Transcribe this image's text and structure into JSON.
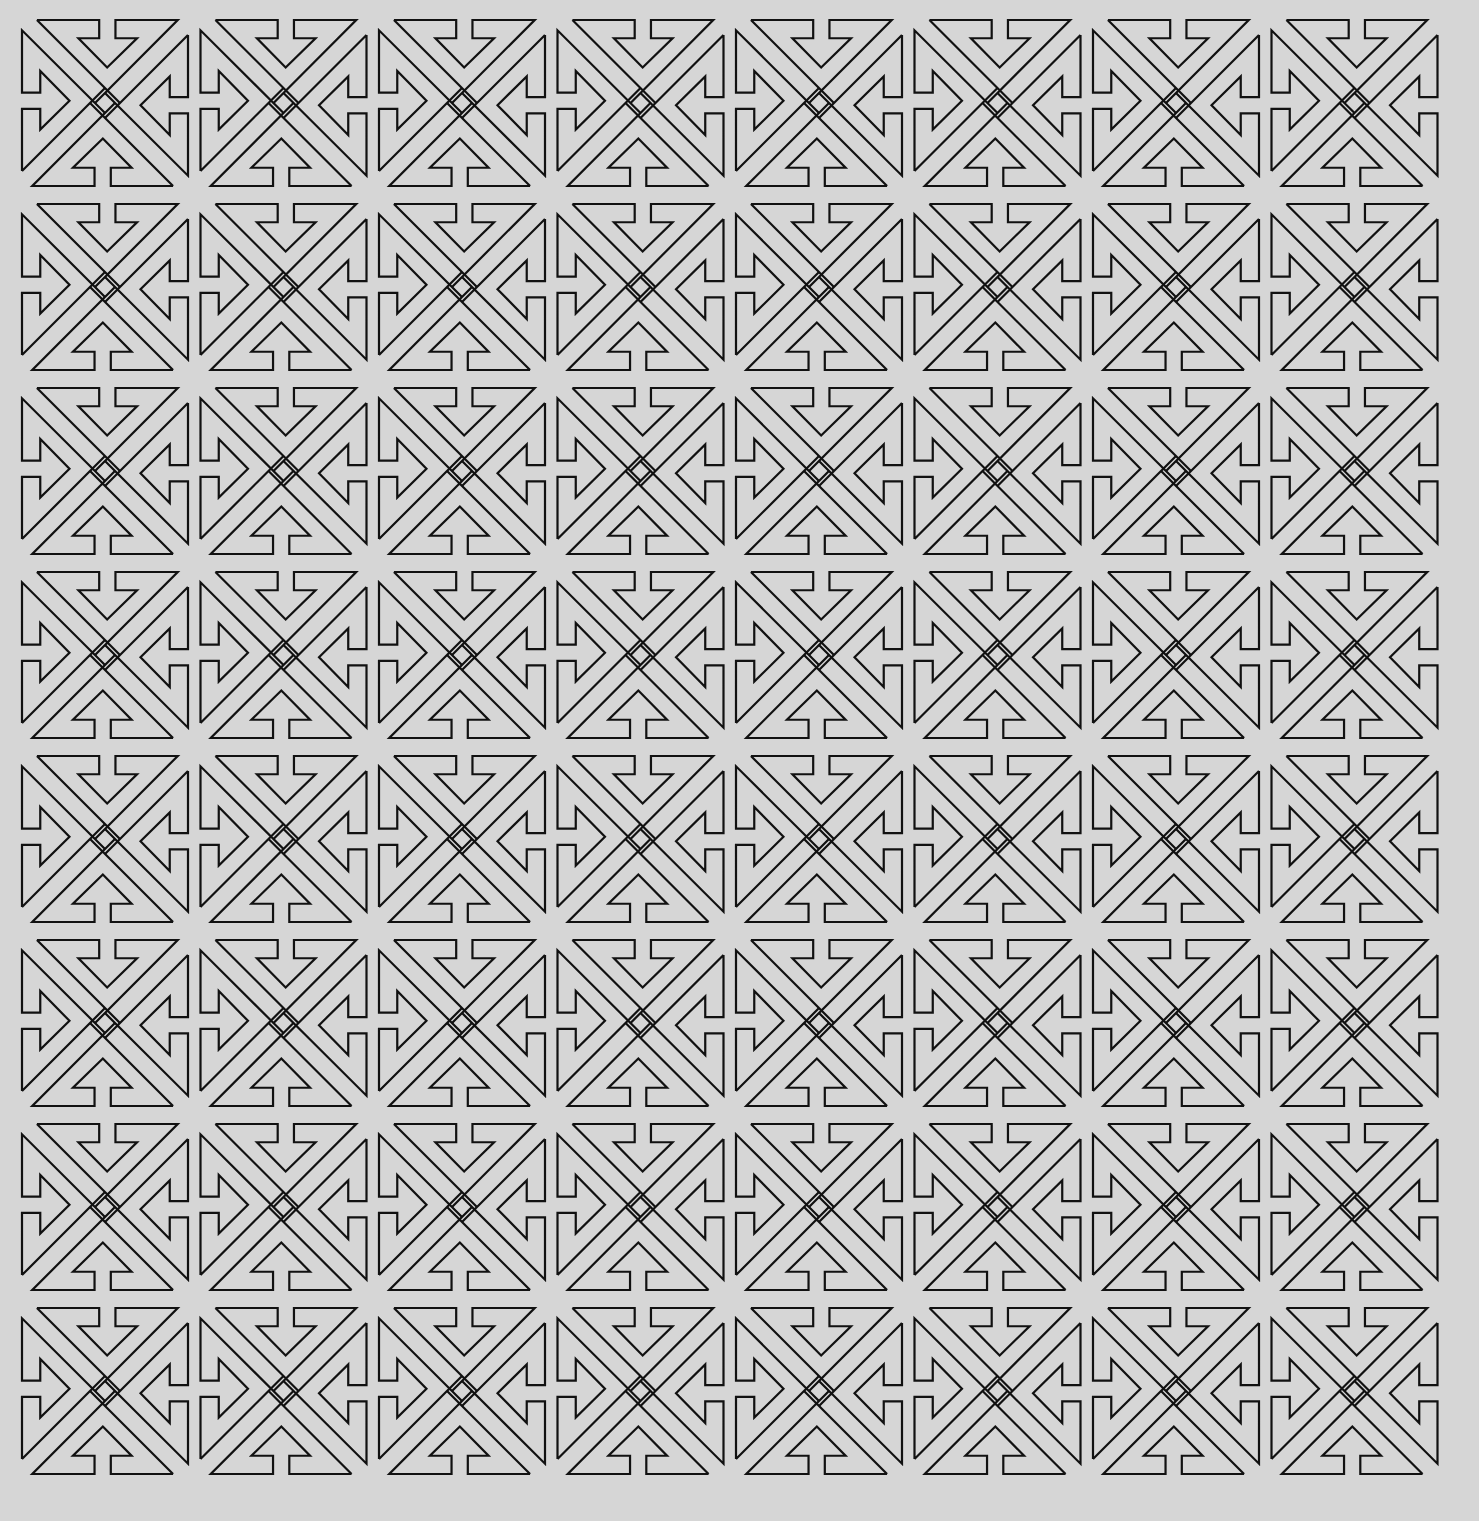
{
  "pattern": {
    "description": "Geometric line-art tiling of interlocking arrow motifs",
    "rows": 8,
    "cols": 8,
    "origin_x": 22,
    "origin_y": 20,
    "step_x": 178.5,
    "step_y": 184,
    "tile_size": 166,
    "stroke_color": "#111111",
    "background_color": "#d6d6d6",
    "stroke_width": 2.2
  }
}
